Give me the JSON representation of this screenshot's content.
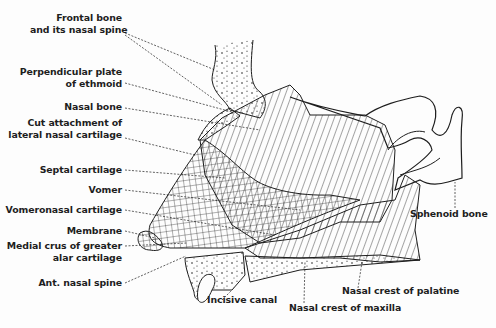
{
  "diagram": {
    "colors": {
      "ink": "#1e1e1e",
      "background": "#fdfdfd"
    },
    "labels": {
      "frontal_bone_1": "Frontal bone",
      "frontal_bone_2": "and its nasal spine",
      "perp_plate_1": "Perpendicular plate",
      "perp_plate_2": "of ethmoid",
      "nasal_bone": "Nasal bone",
      "cut_attach_1": "Cut attachment of",
      "cut_attach_2": "lateral nasal cartilage",
      "septal_cartilage": "Septal cartilage",
      "vomer": "Vomer",
      "vomeronasal_cartilage": "Vomeronasal cartilage",
      "membrane": "Membrane",
      "medial_crus_1": "Medial crus of greater",
      "medial_crus_2": "alar cartilage",
      "ant_nasal_spine": "Ant. nasal spine",
      "incisive_canal": "Incisive canal",
      "nasal_crest_palatine": "Nasal crest of palatine",
      "nasal_crest_maxilla": "Nasal crest of maxilla",
      "sphenoid_bone": "Sphenoid bone"
    }
  }
}
